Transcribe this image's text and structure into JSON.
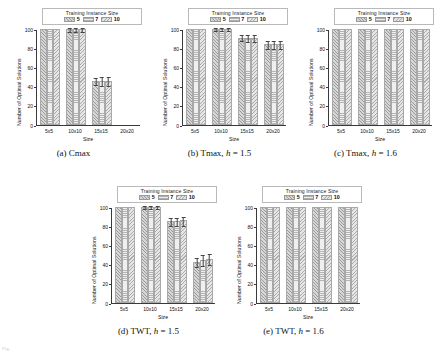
{
  "figure": {
    "legend_title": "Training Instance Size",
    "legend_labels": [
      "5",
      "7",
      "10"
    ],
    "axis": {
      "ylabel": "Number of Optimal Solutions",
      "xlabel": "Size",
      "yticks": [
        "0",
        "20",
        "40",
        "60",
        "80",
        "100"
      ],
      "xticks": [
        "5x5",
        "10x10",
        "15x15",
        "20x20"
      ]
    },
    "captions": {
      "a": "(a) Cmax",
      "b_pre": "(b) Tmax, ",
      "b_h": "h",
      "b_post": " = 1.5",
      "c_pre": "(c) Tmax, ",
      "c_h": "h",
      "c_post": " = 1.6",
      "d_pre": "(d) TWT, ",
      "d_h": "h",
      "d_post": " = 1.5",
      "e_pre": "(e) TWT, ",
      "e_h": "h",
      "e_post": " = 1.6"
    },
    "bottom_note": "Fig."
  },
  "chart_data": [
    {
      "id": "a",
      "type": "bar",
      "title": "(a) Cmax",
      "xlabel": "Size",
      "ylabel": "Number of Optimal Solutions",
      "ylim": [
        0,
        100
      ],
      "yticks": [
        0,
        20,
        40,
        60,
        80,
        100
      ],
      "grid": false,
      "legend": "Training Instance Size",
      "legend_position": "top-center",
      "categories": [
        "5x5",
        "10x10",
        "15x15",
        "20x20"
      ],
      "series": [
        {
          "name": "5",
          "values": [
            100,
            100,
            46,
            0
          ],
          "errors": [
            0,
            0.8,
            2.0,
            0
          ]
        },
        {
          "name": "7",
          "values": [
            100,
            100,
            46,
            0
          ],
          "errors": [
            0,
            0.8,
            2.2,
            0
          ]
        },
        {
          "name": "10",
          "values": [
            100,
            100,
            46,
            0
          ],
          "errors": [
            0,
            0.8,
            2.2,
            0
          ]
        }
      ]
    },
    {
      "id": "b",
      "type": "bar",
      "title": "(b) Tmax, h = 1.5",
      "xlabel": "Size",
      "ylabel": "Number of Optimal Solutions",
      "ylim": [
        0,
        100
      ],
      "yticks": [
        0,
        20,
        40,
        60,
        80,
        100
      ],
      "grid": false,
      "legend": "Training Instance Size",
      "legend_position": "top-center",
      "categories": [
        "5x5",
        "10x10",
        "15x15",
        "20x20"
      ],
      "series": [
        {
          "name": "5",
          "values": [
            100,
            100,
            91,
            84
          ],
          "errors": [
            0,
            0.5,
            1.5,
            2.0
          ]
        },
        {
          "name": "7",
          "values": [
            100,
            100,
            91,
            84
          ],
          "errors": [
            0,
            0.5,
            1.6,
            2.2
          ]
        },
        {
          "name": "10",
          "values": [
            100,
            100,
            91,
            84
          ],
          "errors": [
            0,
            0.5,
            1.6,
            2.2
          ]
        }
      ]
    },
    {
      "id": "c",
      "type": "bar",
      "title": "(c) Tmax, h = 1.6",
      "xlabel": "Size",
      "ylabel": "Number of Optimal Solutions",
      "ylim": [
        0,
        100
      ],
      "yticks": [
        0,
        20,
        40,
        60,
        80,
        100
      ],
      "grid": false,
      "legend": "Training Instance Size",
      "legend_position": "top-center",
      "categories": [
        "5x5",
        "10x10",
        "15x15",
        "20x20"
      ],
      "series": [
        {
          "name": "5",
          "values": [
            100,
            100,
            100,
            100
          ],
          "errors": [
            0,
            0,
            0,
            0
          ]
        },
        {
          "name": "7",
          "values": [
            100,
            100,
            100,
            100
          ],
          "errors": [
            0,
            0,
            0,
            0
          ]
        },
        {
          "name": "10",
          "values": [
            100,
            100,
            100,
            100
          ],
          "errors": [
            0,
            0,
            0,
            0
          ]
        }
      ]
    },
    {
      "id": "d",
      "type": "bar",
      "title": "(d) TWT, h = 1.5",
      "xlabel": "Size",
      "ylabel": "Number of Optimal Solutions",
      "ylim": [
        0,
        100
      ],
      "yticks": [
        0,
        20,
        40,
        60,
        80,
        100
      ],
      "grid": false,
      "legend": "Training Instance Size",
      "legend_position": "top-center",
      "categories": [
        "5x5",
        "10x10",
        "15x15",
        "20x20"
      ],
      "series": [
        {
          "name": "5",
          "values": [
            100,
            100,
            85,
            43
          ],
          "errors": [
            0,
            0.6,
            2.0,
            2.5
          ]
        },
        {
          "name": "7",
          "values": [
            100,
            100,
            85,
            45
          ],
          "errors": [
            0,
            0.6,
            2.2,
            2.8
          ]
        },
        {
          "name": "10",
          "values": [
            100,
            100,
            86,
            46
          ],
          "errors": [
            0,
            0.6,
            2.4,
            3.0
          ]
        }
      ]
    },
    {
      "id": "e",
      "type": "bar",
      "title": "(e) TWT, h = 1.6",
      "xlabel": "Size",
      "ylabel": "Number of Optimal Solutions",
      "ylim": [
        0,
        100
      ],
      "yticks": [
        0,
        20,
        40,
        60,
        80,
        100
      ],
      "grid": false,
      "legend": "Training Instance Size",
      "legend_position": "top-center",
      "categories": [
        "5x5",
        "10x10",
        "15x15",
        "20x20"
      ],
      "series": [
        {
          "name": "5",
          "values": [
            100,
            100,
            100,
            100
          ],
          "errors": [
            0,
            0,
            0,
            0
          ]
        },
        {
          "name": "7",
          "values": [
            100,
            100,
            100,
            100
          ],
          "errors": [
            0,
            0,
            0,
            0
          ]
        },
        {
          "name": "10",
          "values": [
            100,
            100,
            100,
            100
          ],
          "errors": [
            0,
            0,
            0,
            0
          ]
        }
      ]
    }
  ]
}
